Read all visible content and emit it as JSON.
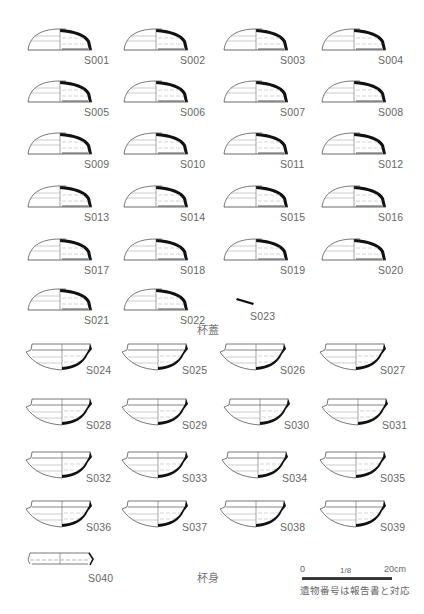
{
  "figure": {
    "lids_caption": "杯蓋",
    "bodies_caption": "杯身",
    "scale": {
      "zero": "0",
      "ratio": "1/8",
      "max": "20cm"
    },
    "note": "遺物番号は報告書と対応"
  },
  "lids": [
    {
      "id": "S001",
      "x": 26,
      "y": 26
    },
    {
      "id": "S002",
      "x": 122,
      "y": 26
    },
    {
      "id": "S003",
      "x": 222,
      "y": 26
    },
    {
      "id": "S004",
      "x": 320,
      "y": 26
    },
    {
      "id": "S005",
      "x": 26,
      "y": 78
    },
    {
      "id": "S006",
      "x": 122,
      "y": 78
    },
    {
      "id": "S007",
      "x": 222,
      "y": 78
    },
    {
      "id": "S008",
      "x": 320,
      "y": 78
    },
    {
      "id": "S009",
      "x": 26,
      "y": 130
    },
    {
      "id": "S010",
      "x": 122,
      "y": 130
    },
    {
      "id": "S011",
      "x": 222,
      "y": 130
    },
    {
      "id": "S012",
      "x": 320,
      "y": 130
    },
    {
      "id": "S013",
      "x": 26,
      "y": 183
    },
    {
      "id": "S014",
      "x": 122,
      "y": 183
    },
    {
      "id": "S015",
      "x": 222,
      "y": 183
    },
    {
      "id": "S016",
      "x": 320,
      "y": 183
    },
    {
      "id": "S017",
      "x": 26,
      "y": 236
    },
    {
      "id": "S018",
      "x": 122,
      "y": 236
    },
    {
      "id": "S019",
      "x": 222,
      "y": 236
    },
    {
      "id": "S020",
      "x": 320,
      "y": 236
    },
    {
      "id": "S021",
      "x": 26,
      "y": 286
    },
    {
      "id": "S022",
      "x": 122,
      "y": 286
    }
  ],
  "fragment": {
    "id": "S023"
  },
  "bodies": [
    {
      "id": "S024",
      "x": 24,
      "y": 342
    },
    {
      "id": "S025",
      "x": 120,
      "y": 342
    },
    {
      "id": "S026",
      "x": 218,
      "y": 342
    },
    {
      "id": "S027",
      "x": 318,
      "y": 342
    },
    {
      "id": "S028",
      "x": 24,
      "y": 397
    },
    {
      "id": "S029",
      "x": 120,
      "y": 397
    },
    {
      "id": "S030",
      "x": 222,
      "y": 397
    },
    {
      "id": "S031",
      "x": 320,
      "y": 397
    },
    {
      "id": "S032",
      "x": 24,
      "y": 450
    },
    {
      "id": "S033",
      "x": 120,
      "y": 450
    },
    {
      "id": "S034",
      "x": 220,
      "y": 450
    },
    {
      "id": "S035",
      "x": 318,
      "y": 450
    },
    {
      "id": "S036",
      "x": 24,
      "y": 499
    },
    {
      "id": "S037",
      "x": 120,
      "y": 499
    },
    {
      "id": "S038",
      "x": 218,
      "y": 499
    },
    {
      "id": "S039",
      "x": 318,
      "y": 499
    }
  ],
  "last_body": {
    "id": "S040"
  }
}
